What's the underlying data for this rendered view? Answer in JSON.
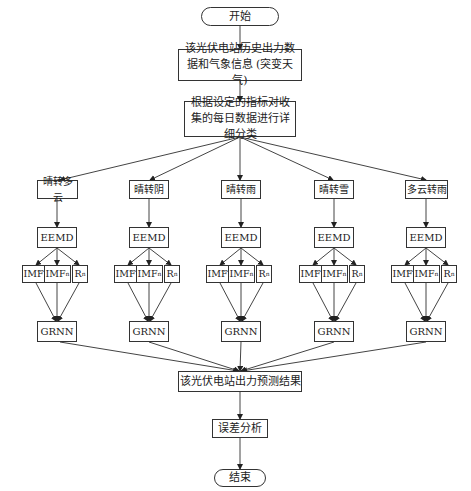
{
  "diagram": {
    "start": "开始",
    "input_data": "该光伏电站历史出力数据和气象信息 (突变天气)",
    "classify": "根据设定的指标对收集的每日数据进行详细分类",
    "branches": [
      {
        "label": "晴转多云",
        "decomp": "EEMD",
        "imf_first": "IMF",
        "imf_first_sub": "1",
        "imf_n": "IMF",
        "imf_n_sub": "n",
        "residual": "R",
        "residual_sub": "n",
        "model": "GRNN"
      },
      {
        "label": "晴转阴",
        "decomp": "EEMD",
        "imf_first": "IMF",
        "imf_first_sub": "1",
        "imf_n": "IMF",
        "imf_n_sub": "n",
        "residual": "R",
        "residual_sub": "n",
        "model": "GRNN"
      },
      {
        "label": "晴转雨",
        "decomp": "EEMD",
        "imf_first": "IMF",
        "imf_first_sub": "1",
        "imf_n": "IMF",
        "imf_n_sub": "n",
        "residual": "R",
        "residual_sub": "n",
        "model": "GRNN"
      },
      {
        "label": "晴转雪",
        "decomp": "EEMD",
        "imf_first": "IMF",
        "imf_first_sub": "1",
        "imf_n": "IMF",
        "imf_n_sub": "n",
        "residual": "R",
        "residual_sub": "n",
        "model": "GRNN"
      },
      {
        "label": "多云转雨",
        "decomp": "EEMD",
        "imf_first": "IMF",
        "imf_first_sub": "1",
        "imf_n": "IMF",
        "imf_n_sub": "n",
        "residual": "R",
        "residual_sub": "n",
        "model": "GRNN"
      }
    ],
    "ellipsis": "···",
    "result": "该光伏电站出力预测结果",
    "error_analysis": "误差分析",
    "end": "结束"
  }
}
